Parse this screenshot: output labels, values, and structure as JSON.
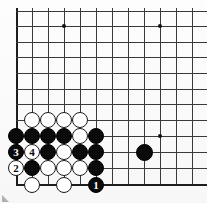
{
  "diagram": {
    "board": {
      "cell_size": 15.8,
      "origin_x": 16,
      "bottom_y": 185,
      "columns_visible": 12,
      "rows_visible": 12,
      "line_color": "#3a3a3a",
      "edge_color": "#1d1d1d",
      "background_color": "#fbfbfb"
    },
    "star_points": [
      {
        "name": "star-point-upper-left",
        "x": 64,
        "y": 26
      },
      {
        "name": "star-point-upper-right",
        "x": 160,
        "y": 26
      },
      {
        "name": "star-point-lower-right",
        "x": 160,
        "y": 136
      }
    ],
    "stones": [
      {
        "id": "w-r1-c2",
        "color": "white",
        "x": 32,
        "y": 120,
        "label": ""
      },
      {
        "id": "w-r1-c3",
        "color": "white",
        "x": 48,
        "y": 120,
        "label": ""
      },
      {
        "id": "w-r1-c4",
        "color": "white",
        "x": 64,
        "y": 120,
        "label": ""
      },
      {
        "id": "w-r1-c5",
        "color": "white",
        "x": 80,
        "y": 120,
        "label": ""
      },
      {
        "id": "b-r2-c1",
        "color": "black",
        "x": 16,
        "y": 136,
        "label": ""
      },
      {
        "id": "b-r2-c2",
        "color": "black",
        "x": 32,
        "y": 136,
        "label": ""
      },
      {
        "id": "b-r2-c3",
        "color": "black",
        "x": 48,
        "y": 136,
        "label": ""
      },
      {
        "id": "b-r2-c4",
        "color": "black",
        "x": 64,
        "y": 136,
        "label": ""
      },
      {
        "id": "w-r2-c5",
        "color": "white",
        "x": 80,
        "y": 136,
        "label": ""
      },
      {
        "id": "b-r2-c6",
        "color": "black",
        "x": 96,
        "y": 136,
        "label": ""
      },
      {
        "id": "b-r3-c1",
        "color": "black",
        "x": 16,
        "y": 152,
        "label": "3"
      },
      {
        "id": "w-r3-c2",
        "color": "white",
        "x": 32,
        "y": 152,
        "label": "4"
      },
      {
        "id": "b-r3-c3",
        "color": "black",
        "x": 48,
        "y": 152,
        "label": ""
      },
      {
        "id": "w-r3-c4",
        "color": "white",
        "x": 64,
        "y": 152,
        "label": ""
      },
      {
        "id": "b-r3-c5",
        "color": "black",
        "x": 80,
        "y": 152,
        "label": ""
      },
      {
        "id": "b-r3-c6",
        "color": "black",
        "x": 96,
        "y": 152,
        "label": ""
      },
      {
        "id": "w-r4-c1",
        "color": "white",
        "x": 16,
        "y": 168,
        "label": "2"
      },
      {
        "id": "b-r4-c2",
        "color": "black",
        "x": 32,
        "y": 168,
        "label": ""
      },
      {
        "id": "w-r4-c3",
        "color": "white",
        "x": 48,
        "y": 168,
        "label": ""
      },
      {
        "id": "w-r4-c4",
        "color": "white",
        "x": 64,
        "y": 168,
        "label": ""
      },
      {
        "id": "w-r4-c5",
        "color": "white",
        "x": 80,
        "y": 168,
        "label": ""
      },
      {
        "id": "b-r4-c6",
        "color": "black",
        "x": 96,
        "y": 168,
        "label": ""
      },
      {
        "id": "w-r5-c2",
        "color": "white",
        "x": 32,
        "y": 185,
        "label": ""
      },
      {
        "id": "w-r5-c4",
        "color": "white",
        "x": 64,
        "y": 185,
        "label": ""
      },
      {
        "id": "b-r5-c6",
        "color": "black",
        "x": 96,
        "y": 185,
        "label": "1"
      },
      {
        "id": "b-right-side",
        "color": "black",
        "x": 145,
        "y": 153,
        "label": "",
        "big": true
      }
    ],
    "move_numbers": {
      "move_1": "1",
      "move_2": "2",
      "move_3": "3",
      "move_4": "4"
    }
  }
}
